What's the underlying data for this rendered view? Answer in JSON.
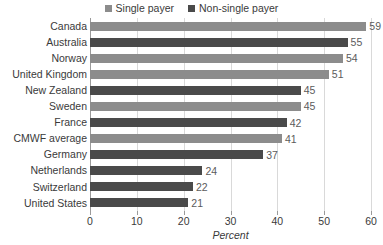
{
  "chart_data": {
    "type": "bar",
    "orientation": "horizontal",
    "title": "",
    "xlabel": "Percent",
    "ylabel": "",
    "xlim": [
      0,
      60
    ],
    "xticks": [
      0,
      10,
      20,
      30,
      40,
      50,
      60
    ],
    "grid": true,
    "legend_position": "top-center",
    "categories": [
      "Canada",
      "Australia",
      "Norway",
      "United Kingdom",
      "New Zealand",
      "Sweden",
      "France",
      "CMWF average",
      "Germany",
      "Netherlands",
      "Switzerland",
      "United States"
    ],
    "values": [
      59,
      55,
      54,
      51,
      45,
      45,
      42,
      41,
      37,
      24,
      22,
      21
    ],
    "series_of_bar": [
      "Single payer",
      "Non-single payer",
      "Single payer",
      "Single payer",
      "Non-single payer",
      "Single payer",
      "Non-single payer",
      "Single payer",
      "Non-single payer",
      "Non-single payer",
      "Non-single payer",
      "Non-single payer"
    ],
    "legend": [
      {
        "label": "Single payer",
        "color": "#8c8c8c"
      },
      {
        "label": "Non-single payer",
        "color": "#4a4a4a"
      }
    ]
  },
  "colors": {
    "single_payer": "#8c8c8c",
    "non_single_payer": "#4a4a4a",
    "gridline": "#d9d9d9",
    "axis": "#9a9a9a",
    "text": "#3a3a3a",
    "value_text": "#5b5b5b",
    "background": "#ffffff"
  }
}
